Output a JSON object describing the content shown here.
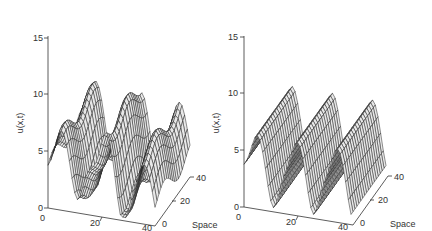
{
  "chart_data": [
    {
      "type": "surface",
      "title": "",
      "zlabel": "u(x,t)",
      "xlabel": "",
      "ylabel": "Space",
      "zlim": [
        0,
        15
      ],
      "z_ticks": [
        "0",
        "5",
        "10",
        "15"
      ],
      "x_ticks": [
        "0",
        "20",
        "40"
      ],
      "y_ticks": [
        "0",
        "20",
        "40"
      ],
      "grid": false,
      "description": "Wireframe surface with irregular peaks; max around 8.5, baseline ~5, troughs near 0",
      "peaks": [
        {
          "x": 5,
          "z": 7.5
        },
        {
          "x": 22,
          "z": 8.5
        },
        {
          "x": 36,
          "z": 7.0
        }
      ]
    },
    {
      "type": "surface",
      "title": "",
      "zlabel": "u(x,t)",
      "xlabel": "",
      "ylabel": "Space",
      "zlim": [
        0,
        15
      ],
      "z_ticks": [
        "0",
        "5",
        "10",
        "15"
      ],
      "x_ticks": [
        "0",
        "20",
        "40"
      ],
      "y_ticks": [
        "0",
        "20",
        "40"
      ],
      "grid": false,
      "description": "Wireframe surface with regular periodic peaks ~7.5 and troughs near 0",
      "peaks": [
        {
          "x": 5,
          "z": 7.5
        },
        {
          "x": 20,
          "z": 7.5
        },
        {
          "x": 35,
          "z": 7.5
        }
      ]
    }
  ],
  "panels": [
    {
      "zlabel": "u(x,t)",
      "z_ticks": [
        "15",
        "10",
        "5",
        "0"
      ],
      "x_ticks": [
        "0",
        "20",
        "40"
      ],
      "depth_ticks": [
        "0",
        "20",
        "40"
      ],
      "depth_label": "Space"
    },
    {
      "zlabel": "u(x,t)",
      "z_ticks": [
        "15",
        "10",
        "5",
        "0"
      ],
      "x_ticks": [
        "0",
        "20",
        "40"
      ],
      "depth_ticks": [
        "0",
        "20",
        "40"
      ],
      "depth_label": "Space"
    }
  ]
}
